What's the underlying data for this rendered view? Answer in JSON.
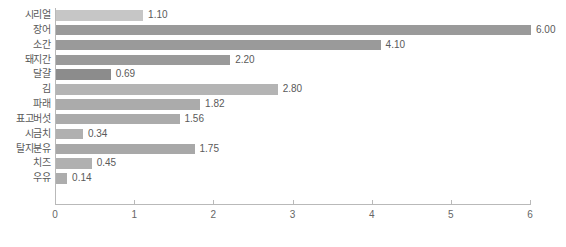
{
  "chart": {
    "type": "bar",
    "orientation": "horizontal",
    "title": "",
    "xlabel": "",
    "ylabel": ""
  },
  "chart_data": {
    "type": "bar",
    "title": "",
    "subtitle": "",
    "xlabel": "",
    "ylabel": "",
    "orientation": "horizontal",
    "grid": false,
    "legend": null,
    "xlim": [
      0,
      6
    ],
    "xticks": [
      "0",
      "1",
      "2",
      "3",
      "4",
      "5",
      "6"
    ],
    "categories": [
      "시리얼",
      "장어",
      "소간",
      "돼지간",
      "달걀",
      "김",
      "파래",
      "표고버섯",
      "시금치",
      "탈지분유",
      "치즈",
      "우유"
    ],
    "values": [
      1.1,
      6.0,
      4.1,
      2.2,
      0.69,
      2.8,
      1.82,
      1.56,
      0.34,
      1.75,
      0.45,
      0.14
    ],
    "value_labels": [
      "1.10",
      "6.00",
      "4.10",
      "2.20",
      "0.69",
      "2.80",
      "1.82",
      "1.56",
      "0.34",
      "1.75",
      "0.45",
      "0.14"
    ],
    "bar_colors": [
      "#c6c6c6",
      "#9a9a9a",
      "#9a9a9a",
      "#9a9a9a",
      "#8c8c8c",
      "#b4b4b4",
      "#ababab",
      "#ababab",
      "#b0b0b0",
      "#a8a8a8",
      "#b0b0b0",
      "#adadad"
    ]
  },
  "axis": {
    "x_tick_labels": [
      "0",
      "1",
      "2",
      "3",
      "4",
      "5",
      "6"
    ],
    "axis_color": "#b9b9b9"
  },
  "rows": [
    {
      "label": "시리얼",
      "value": 1.1,
      "value_label": "1.10",
      "color": "#c6c6c6"
    },
    {
      "label": "장어",
      "value": 6.0,
      "value_label": "6.00",
      "color": "#9a9a9a"
    },
    {
      "label": "소간",
      "value": 4.1,
      "value_label": "4.10",
      "color": "#9a9a9a"
    },
    {
      "label": "돼지간",
      "value": 2.2,
      "value_label": "2.20",
      "color": "#9a9a9a"
    },
    {
      "label": "달걀",
      "value": 0.69,
      "value_label": "0.69",
      "color": "#8c8c8c"
    },
    {
      "label": "김",
      "value": 2.8,
      "value_label": "2.80",
      "color": "#b4b4b4"
    },
    {
      "label": "파래",
      "value": 1.82,
      "value_label": "1.82",
      "color": "#ababab"
    },
    {
      "label": "표고버섯",
      "value": 1.56,
      "value_label": "1.56",
      "color": "#ababab"
    },
    {
      "label": "시금치",
      "value": 0.34,
      "value_label": "0.34",
      "color": "#b0b0b0"
    },
    {
      "label": "탈지분유",
      "value": 1.75,
      "value_label": "1.75",
      "color": "#a8a8a8"
    },
    {
      "label": "치즈",
      "value": 0.45,
      "value_label": "0.45",
      "color": "#b0b0b0"
    },
    {
      "label": "우유",
      "value": 0.14,
      "value_label": "0.14",
      "color": "#adadad"
    }
  ]
}
